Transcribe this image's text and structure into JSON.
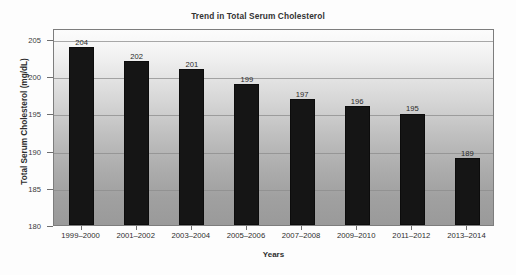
{
  "chart_data": {
    "type": "bar",
    "title": "Trend in Total Serum Cholesterol",
    "xlabel": "Years",
    "ylabel": "Total Serum Cholesterol (mg/dL)",
    "categories": [
      "1999–2000",
      "2001–2002",
      "2003–2004",
      "2005–2006",
      "2007–2008",
      "2009–2010",
      "2011–2012",
      "2013–2014"
    ],
    "values": [
      204,
      202,
      201,
      199,
      197,
      196,
      195,
      189
    ],
    "value_labels": [
      "204",
      "202",
      "201",
      "199",
      "197",
      "196",
      "195",
      "189"
    ],
    "ylim": [
      180,
      206.5
    ],
    "y_ticks": [
      180,
      185,
      190,
      195,
      200,
      205
    ],
    "y_tick_labels": [
      "180",
      "185",
      "190",
      "195",
      "200",
      "205"
    ],
    "grid": true,
    "legend": false,
    "legend_position": "none",
    "bar_color": "#151515",
    "plot_background_top": "#fcfcfc",
    "plot_background_bottom": "#9a9a9a",
    "gridline_color": "#8c8c8c",
    "axis_color": "#7d7d7d"
  }
}
